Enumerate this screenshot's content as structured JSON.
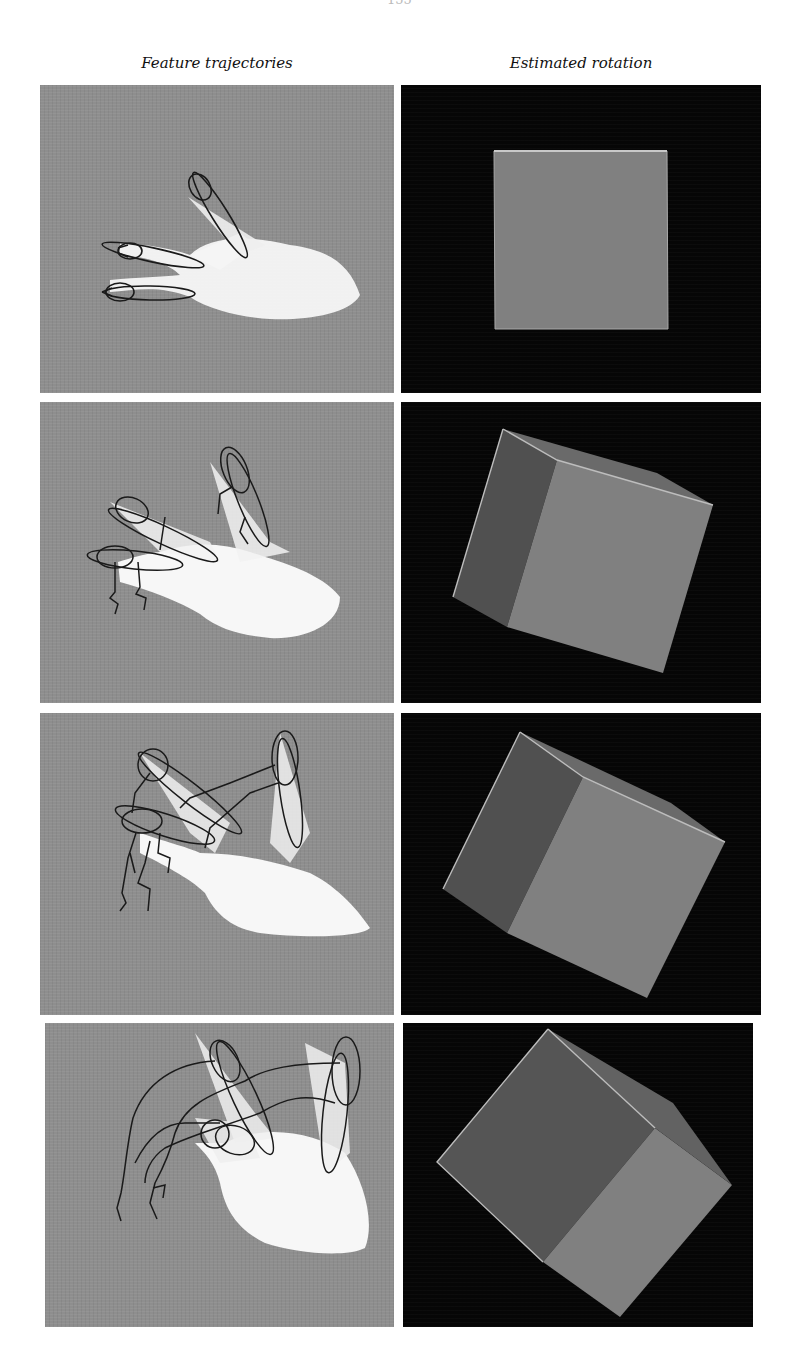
{
  "page": {
    "page_number": "155"
  },
  "figure": {
    "columns": [
      {
        "label": "Feature trajectories"
      },
      {
        "label": "Estimated rotation"
      }
    ],
    "colors": {
      "left_background": "#8e8e8e",
      "hand": "#f6f6f6",
      "trajectory_ink": "#1a1a1a",
      "right_background": "#060606",
      "cube_front_face": "#808080",
      "cube_side_face": "#555555",
      "cube_edge": "#bdbdbd"
    },
    "rows": [
      {
        "index": 1,
        "left_panel": "hand with three tracked fingertip ellipses, no trajectories",
        "right_panel": "cube viewed face-on (square)"
      },
      {
        "index": 2,
        "left_panel": "hand rotating, short fingertip trajectories",
        "right_panel": "cube rotated, front and left face visible"
      },
      {
        "index": 3,
        "left_panel": "hand rotated further, longer trajectories",
        "right_panel": "cube rotated further"
      },
      {
        "index": 4,
        "left_panel": "hand rotated most, long arcing trajectories",
        "right_panel": "cube rotated ~45 degrees"
      }
    ]
  }
}
